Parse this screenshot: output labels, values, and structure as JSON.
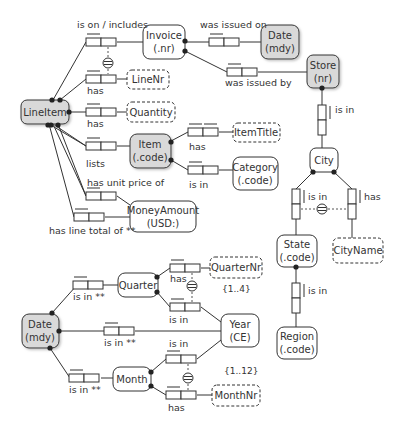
{
  "diagram": {
    "type": "ORM schema",
    "entities": [
      {
        "id": "lineitem",
        "name": "LineItem",
        "ref": "",
        "shaded": true
      },
      {
        "id": "invoice",
        "name": "Invoice",
        "ref": "(.nr)",
        "shaded": false
      },
      {
        "id": "date_top",
        "name": "Date",
        "ref": "(mdy)",
        "shaded": true
      },
      {
        "id": "store",
        "name": "Store",
        "ref": "(nr)",
        "shaded": true
      },
      {
        "id": "item",
        "name": "Item",
        "ref": "(.code)",
        "shaded": true
      },
      {
        "id": "category",
        "name": "Category",
        "ref": "(.code)",
        "shaded": false
      },
      {
        "id": "money",
        "name": "MoneyAmount",
        "ref": "(USD:)",
        "shaded": false
      },
      {
        "id": "city",
        "name": "City",
        "ref": "",
        "shaded": false
      },
      {
        "id": "state",
        "name": "State",
        "ref": "(.code)",
        "shaded": false
      },
      {
        "id": "region",
        "name": "Region",
        "ref": "(.code)",
        "shaded": false
      },
      {
        "id": "date_bottom",
        "name": "Date",
        "ref": "(mdy)",
        "shaded": true
      },
      {
        "id": "quarter",
        "name": "Quarter",
        "ref": "",
        "shaded": false
      },
      {
        "id": "year",
        "name": "Year",
        "ref": "(CE)",
        "shaded": false
      },
      {
        "id": "month",
        "name": "Month",
        "ref": "",
        "shaded": false
      }
    ],
    "value_types": [
      {
        "id": "linenr",
        "name": "LineNr"
      },
      {
        "id": "quantity",
        "name": "Quantity"
      },
      {
        "id": "itemtitle",
        "name": "ItemTitle"
      },
      {
        "id": "cityname",
        "name": "CityName"
      },
      {
        "id": "quarternr",
        "name": "QuarterNr"
      },
      {
        "id": "monthnr",
        "name": "MonthNr"
      }
    ],
    "fact_labels": {
      "lineitem_invoice": "is on / includes",
      "invoice_date": "was issued on",
      "invoice_store": "was issued by",
      "lineitem_linenr": "has",
      "lineitem_quantity": "has",
      "lineitem_item": "lists",
      "item_itemtitle": "has",
      "item_category": "is in",
      "lineitem_unitprice": "has unit price of",
      "lineitem_total": "has line total of **",
      "store_city": "is in",
      "city_state": "is in",
      "city_cityname": "has",
      "state_region": "is in",
      "date_quarter": "is in **",
      "quarter_quarternr": "has",
      "quarter_year": "is in",
      "date_year": "is in **",
      "month_year": "is in",
      "date_month": "is in **",
      "month_monthnr": "has"
    },
    "value_constraints": {
      "quarternr": "{1..4}",
      "monthnr": "{1..12}"
    },
    "colors": {
      "shaded_fill": "#d9d9d9",
      "stroke": "#333333",
      "background": "#ffffff"
    }
  }
}
